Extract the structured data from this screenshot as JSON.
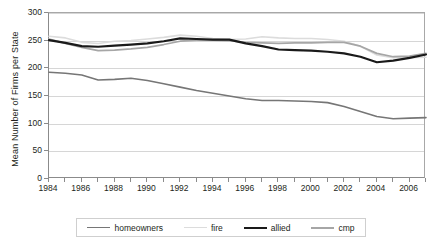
{
  "chart_data": {
    "type": "line",
    "title": "",
    "xlabel": "",
    "ylabel": "Mean Number of Firms per State",
    "xlim": [
      1984,
      2007
    ],
    "ylim": [
      0,
      300
    ],
    "grid": true,
    "legend_position": "bottom",
    "y_ticks": [
      0,
      50,
      100,
      150,
      200,
      250,
      300
    ],
    "x_ticks": [
      1984,
      1985,
      1986,
      1987,
      1988,
      1989,
      1990,
      1991,
      1992,
      1993,
      1994,
      1995,
      1996,
      1997,
      1998,
      1999,
      2000,
      2001,
      2002,
      2003,
      2004,
      2005,
      2006,
      2007
    ],
    "x_tick_labels": [
      1984,
      1986,
      1988,
      1990,
      1992,
      1994,
      1996,
      1998,
      2000,
      2002,
      2004,
      2006
    ],
    "x": [
      1984,
      1985,
      1986,
      1987,
      1988,
      1989,
      1990,
      1991,
      1992,
      1993,
      1994,
      1995,
      1996,
      1997,
      1998,
      1999,
      2000,
      2001,
      2002,
      2003,
      2004,
      2005,
      2006,
      2007
    ],
    "series": [
      {
        "name": "homeowners",
        "color": "#767676",
        "width": 1.6,
        "values": [
          193,
          191,
          188,
          179,
          180,
          182,
          178,
          172,
          166,
          160,
          155,
          150,
          145,
          142,
          142,
          141,
          140,
          138,
          131,
          122,
          113,
          109,
          110,
          111
        ]
      },
      {
        "name": "fire",
        "color": "#dcdcdc",
        "width": 1.6,
        "values": [
          258,
          255,
          247,
          245,
          249,
          250,
          253,
          256,
          260,
          258,
          254,
          252,
          253,
          257,
          255,
          254,
          254,
          252,
          249,
          240,
          224,
          219,
          219,
          220
        ]
      },
      {
        "name": "allied",
        "color": "#1a1a1a",
        "width": 2.2,
        "values": [
          251,
          246,
          240,
          239,
          241,
          243,
          245,
          249,
          254,
          253,
          252,
          252,
          245,
          240,
          234,
          233,
          232,
          230,
          227,
          221,
          211,
          214,
          219,
          225
        ]
      },
      {
        "name": "cmp",
        "color": "#a6a6a6",
        "width": 1.7,
        "values": [
          253,
          245,
          238,
          232,
          233,
          235,
          238,
          243,
          249,
          251,
          251,
          250,
          247,
          246,
          245,
          246,
          246,
          247,
          247,
          240,
          227,
          221,
          222,
          227
        ]
      }
    ]
  },
  "legend": {
    "items": [
      {
        "label": "homeowners",
        "color": "#767676",
        "width": 1.8
      },
      {
        "label": "fire",
        "color": "#dcdcdc",
        "width": 1.8
      },
      {
        "label": "allied",
        "color": "#1a1a1a",
        "width": 2.6
      },
      {
        "label": "cmp",
        "color": "#a6a6a6",
        "width": 2
      }
    ]
  }
}
